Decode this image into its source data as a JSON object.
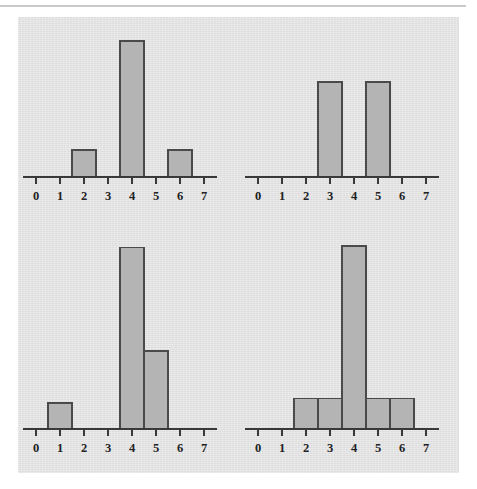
{
  "figure": {
    "background_color": "#e3e3e3",
    "page_color": "#ffffff",
    "rule_color": "#c9c9c9",
    "bar_fill_color": "#b4b4b4",
    "bar_stroke_color": "#4a4a4c",
    "axis_color": "#39393a",
    "panel_count": 4
  },
  "chart_data": [
    {
      "id": "chart-top-left",
      "type": "bar",
      "title": "",
      "subtitle": "",
      "xlabel": "",
      "ylabel": "",
      "grid": false,
      "legend": null,
      "annotations": [],
      "position": "top-left",
      "bin_edges": [
        1.5,
        2.5,
        3.5,
        4.5,
        5.5,
        6.5
      ],
      "categories": [
        "2",
        "4",
        "6"
      ],
      "x": [
        2,
        4,
        6
      ],
      "values": [
        1,
        5,
        1
      ],
      "bars": [
        {
          "center": 2,
          "left": 1.5,
          "right": 2.5,
          "height": 1
        },
        {
          "center": 4,
          "left": 3.5,
          "right": 4.5,
          "height": 5
        },
        {
          "center": 6,
          "left": 5.5,
          "right": 6.5,
          "height": 1
        }
      ],
      "axis_ticks": [
        0,
        1,
        2,
        3,
        4,
        5,
        6,
        7
      ],
      "tick_labels": [
        "0",
        "1",
        "2",
        "3",
        "4",
        "5",
        "6",
        "7"
      ],
      "xlim": [
        -0.55,
        7.55
      ],
      "ylim": [
        0,
        5.3
      ]
    },
    {
      "id": "chart-top-right",
      "type": "bar",
      "title": "",
      "subtitle": "",
      "xlabel": "",
      "ylabel": "",
      "grid": false,
      "legend": null,
      "annotations": [],
      "position": "top-right",
      "bin_edges": [
        2.5,
        3.5,
        4.5,
        5.5
      ],
      "categories": [
        "3",
        "5"
      ],
      "x": [
        3,
        5
      ],
      "values": [
        3.5,
        3.5
      ],
      "bars": [
        {
          "center": 3,
          "left": 2.5,
          "right": 3.5,
          "height": 3.5
        },
        {
          "center": 5,
          "left": 4.5,
          "right": 5.5,
          "height": 3.5
        }
      ],
      "axis_ticks": [
        0,
        1,
        2,
        3,
        4,
        5,
        6,
        7
      ],
      "tick_labels": [
        "0",
        "1",
        "2",
        "3",
        "4",
        "5",
        "6",
        "7"
      ],
      "xlim": [
        -0.55,
        7.55
      ],
      "ylim": [
        0,
        5.3
      ]
    },
    {
      "id": "chart-bottom-left",
      "type": "bar",
      "title": "",
      "subtitle": "",
      "xlabel": "",
      "ylabel": "",
      "grid": false,
      "legend": null,
      "annotations": [],
      "position": "bottom-left",
      "bin_edges": [
        0.5,
        1.5,
        3.5,
        4.5,
        5.5
      ],
      "categories": [
        "1",
        "4",
        "5"
      ],
      "x": [
        1,
        4,
        5
      ],
      "values": [
        1,
        7,
        3
      ],
      "bars": [
        {
          "center": 1,
          "left": 0.5,
          "right": 1.5,
          "height": 1
        },
        {
          "center": 4,
          "left": 3.5,
          "right": 4.5,
          "height": 7
        },
        {
          "center": 5,
          "left": 4.5,
          "right": 5.5,
          "height": 3
        }
      ],
      "axis_ticks": [
        0,
        1,
        2,
        3,
        4,
        5,
        6,
        7
      ],
      "tick_labels": [
        "0",
        "1",
        "2",
        "3",
        "4",
        "5",
        "6",
        "7"
      ],
      "xlim": [
        -0.55,
        7.55
      ],
      "ylim": [
        0,
        7.4
      ]
    },
    {
      "id": "chart-bottom-right",
      "type": "bar",
      "title": "",
      "subtitle": "",
      "xlabel": "",
      "ylabel": "",
      "grid": false,
      "legend": null,
      "annotations": [],
      "position": "bottom-right",
      "bin_edges": [
        1.5,
        2.5,
        3.5,
        4.5,
        5.5,
        6.5
      ],
      "categories": [
        "2",
        "3",
        "4",
        "5",
        "6"
      ],
      "x": [
        2,
        3,
        4,
        5,
        6
      ],
      "values": [
        1,
        1,
        6,
        1,
        1
      ],
      "bars": [
        {
          "center": 2,
          "left": 1.5,
          "right": 2.5,
          "height": 1
        },
        {
          "center": 3,
          "left": 2.5,
          "right": 3.5,
          "height": 1
        },
        {
          "center": 4,
          "left": 3.5,
          "right": 4.5,
          "height": 6
        },
        {
          "center": 5,
          "left": 4.5,
          "right": 5.5,
          "height": 1
        },
        {
          "center": 6,
          "left": 5.5,
          "right": 6.5,
          "height": 1
        }
      ],
      "axis_ticks": [
        0,
        1,
        2,
        3,
        4,
        5,
        6,
        7
      ],
      "tick_labels": [
        "0",
        "1",
        "2",
        "3",
        "4",
        "5",
        "6",
        "7"
      ],
      "xlim": [
        -0.55,
        7.55
      ],
      "ylim": [
        0,
        6.3
      ]
    }
  ]
}
